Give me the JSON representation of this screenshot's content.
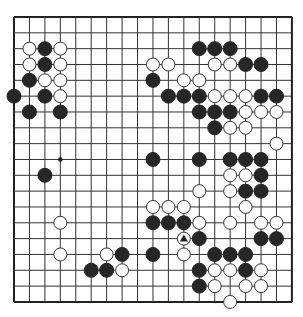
{
  "board": {
    "size": 19,
    "origin_x": 14,
    "origin_y": 17,
    "spacing_x": 15.44,
    "spacing_y": 15.83,
    "stone_radius": 7,
    "colors": {
      "background": "#ffffff",
      "line": "#333333",
      "border": "#222222",
      "black_stone": "#262626",
      "white_stone": "#ffffff",
      "white_stone_outline": "#333333",
      "marker": "#222222"
    },
    "star_points": [
      [
        3,
        9
      ]
    ],
    "black_stones": [
      [
        2,
        2
      ],
      [
        2,
        3
      ],
      [
        1,
        4
      ],
      [
        0,
        5
      ],
      [
        2,
        5
      ],
      [
        1,
        6
      ],
      [
        3,
        6
      ],
      [
        12,
        2
      ],
      [
        13,
        2
      ],
      [
        14,
        2
      ],
      [
        15,
        3
      ],
      [
        16,
        3
      ],
      [
        9,
        4
      ],
      [
        10,
        5
      ],
      [
        11,
        5
      ],
      [
        12,
        5
      ],
      [
        16,
        5
      ],
      [
        17,
        5
      ],
      [
        12,
        6
      ],
      [
        13,
        6
      ],
      [
        14,
        6
      ],
      [
        13,
        7
      ],
      [
        9,
        9
      ],
      [
        12,
        9
      ],
      [
        14,
        9
      ],
      [
        15,
        9
      ],
      [
        16,
        9
      ],
      [
        2,
        10
      ],
      [
        16,
        10
      ],
      [
        15,
        11
      ],
      [
        16,
        11
      ],
      [
        9,
        13
      ],
      [
        10,
        13
      ],
      [
        11,
        13
      ],
      [
        12,
        14
      ],
      [
        16,
        14
      ],
      [
        17,
        14
      ],
      [
        7,
        15
      ],
      [
        9,
        15
      ],
      [
        13,
        15
      ],
      [
        14,
        15
      ],
      [
        15,
        15
      ],
      [
        5,
        16
      ],
      [
        6,
        16
      ],
      [
        12,
        16
      ],
      [
        15,
        16
      ],
      [
        12,
        17
      ]
    ],
    "white_stones": [
      [
        1,
        2
      ],
      [
        3,
        2
      ],
      [
        1,
        3
      ],
      [
        3,
        3
      ],
      [
        2,
        4
      ],
      [
        3,
        4
      ],
      [
        3,
        5
      ],
      [
        9,
        3
      ],
      [
        10,
        3
      ],
      [
        13,
        3
      ],
      [
        14,
        3
      ],
      [
        11,
        4
      ],
      [
        12,
        4
      ],
      [
        13,
        5
      ],
      [
        14,
        5
      ],
      [
        15,
        5
      ],
      [
        15,
        6
      ],
      [
        16,
        6
      ],
      [
        17,
        6
      ],
      [
        14,
        7
      ],
      [
        15,
        7
      ],
      [
        17,
        8
      ],
      [
        14,
        10
      ],
      [
        15,
        10
      ],
      [
        12,
        11
      ],
      [
        14,
        11
      ],
      [
        9,
        12
      ],
      [
        10,
        12
      ],
      [
        11,
        12
      ],
      [
        15,
        12
      ],
      [
        3,
        13
      ],
      [
        12,
        13
      ],
      [
        14,
        13
      ],
      [
        16,
        13
      ],
      [
        17,
        13
      ],
      [
        11,
        14
      ],
      [
        3,
        15
      ],
      [
        6,
        15
      ],
      [
        11,
        15
      ],
      [
        7,
        16
      ],
      [
        13,
        16
      ],
      [
        14,
        16
      ],
      [
        16,
        16
      ],
      [
        13,
        17
      ],
      [
        15,
        17
      ],
      [
        16,
        17
      ],
      [
        14,
        18
      ]
    ],
    "markers": [
      {
        "type": "triangle",
        "point": [
          11,
          14
        ],
        "on": "white"
      }
    ]
  }
}
